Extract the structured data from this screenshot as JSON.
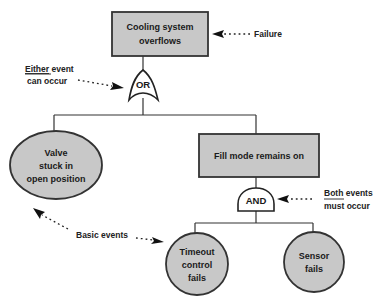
{
  "diagram": {
    "type": "fault-tree",
    "colors": {
      "event_fill": "#c8c8c8",
      "stroke": "#333333",
      "gate_fill": "#ffffff",
      "background": "#ffffff"
    },
    "top_event": {
      "lines": [
        "Cooling system",
        "overflows"
      ]
    },
    "or_gate": {
      "label": "OR"
    },
    "valve_event": {
      "lines": [
        "Valve",
        "stuck in",
        "open position"
      ]
    },
    "fill_event": {
      "lines": [
        "Fill mode remains on"
      ]
    },
    "and_gate": {
      "label": "AND"
    },
    "timeout_event": {
      "lines": [
        "Timeout",
        "control",
        "fails"
      ]
    },
    "sensor_event": {
      "lines": [
        "Sensor",
        "fails"
      ]
    },
    "annotations": {
      "failure": {
        "text": "Failure"
      },
      "either": {
        "underlined": "Either",
        "rest": " event",
        "line2": "can occur"
      },
      "both": {
        "underlined": "Both",
        "rest": " events",
        "line2": "must occur"
      },
      "basic": {
        "text": "Basic events"
      }
    }
  }
}
